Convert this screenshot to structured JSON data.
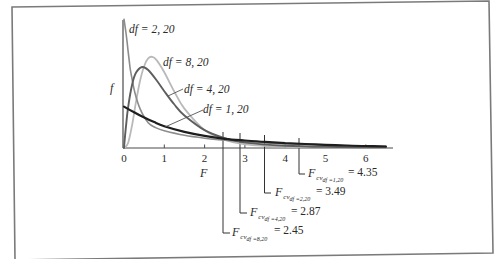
{
  "chart_data": {
    "type": "line",
    "title": "",
    "xlabel": "F",
    "ylabel": "f",
    "xlim": [
      0,
      6.7
    ],
    "ylim": [
      0,
      1.15
    ],
    "grid": false,
    "legend": "inline labels on curves",
    "x_ticks": [
      "0",
      "1",
      "2",
      "3",
      "4",
      "5",
      "6"
    ],
    "series": [
      {
        "name": "df = 1, 20",
        "color": "#1e1e1e",
        "width": 2.2,
        "x": [
          0,
          0.25,
          0.5,
          0.75,
          1,
          1.5,
          2,
          2.5,
          3,
          3.5,
          4,
          4.5,
          5,
          5.5,
          6,
          6.5
        ],
        "y": [
          0.36,
          0.31,
          0.265,
          0.225,
          0.19,
          0.14,
          0.105,
          0.08,
          0.065,
          0.053,
          0.043,
          0.035,
          0.028,
          0.022,
          0.017,
          0.013
        ]
      },
      {
        "name": "df = 2, 20",
        "color": "#8c8c8c",
        "width": 1.6,
        "x": [
          0,
          0.05,
          0.1,
          0.15,
          0.2,
          0.27,
          0.4,
          0.6,
          0.8,
          1,
          1.5,
          2,
          2.5,
          3,
          4,
          5,
          6,
          6.5
        ],
        "y": [
          1.12,
          1.0,
          0.85,
          0.7,
          0.6,
          0.48,
          0.34,
          0.22,
          0.175,
          0.15,
          0.11,
          0.085,
          0.068,
          0.055,
          0.037,
          0.025,
          0.017,
          0.014
        ]
      },
      {
        "name": "df = 4, 20",
        "color": "#5e5e5e",
        "width": 1.9,
        "x": [
          0,
          0.05,
          0.1,
          0.2,
          0.3,
          0.45,
          0.6,
          0.8,
          1,
          1.25,
          1.5,
          2,
          2.5,
          3,
          4,
          5,
          6,
          6.5
        ],
        "y": [
          0,
          0.19,
          0.347,
          0.55,
          0.656,
          0.704,
          0.678,
          0.593,
          0.494,
          0.378,
          0.283,
          0.155,
          0.085,
          0.047,
          0.02,
          0.01,
          0.006,
          0.005
        ]
      },
      {
        "name": "df = 8, 20",
        "color": "#b9b9b9",
        "width": 1.8,
        "x": [
          0,
          0.1,
          0.2,
          0.3,
          0.4,
          0.5,
          0.6,
          0.7,
          0.8,
          1,
          1.25,
          1.5,
          2,
          2.5,
          3,
          4,
          5,
          6,
          6.5
        ],
        "y": [
          0,
          0.042,
          0.199,
          0.405,
          0.587,
          0.713,
          0.779,
          0.793,
          0.769,
          0.659,
          0.49,
          0.343,
          0.156,
          0.07,
          0.032,
          0.01,
          0.005,
          0.003,
          0.002
        ]
      }
    ],
    "critical_values": [
      {
        "symbol": "F",
        "sub": "cv",
        "df": "df =8,20",
        "eq": "= 2.45",
        "value": 2.45
      },
      {
        "symbol": "F",
        "sub": "cv",
        "df": "df =4,20",
        "eq": "= 2.87",
        "value": 2.87
      },
      {
        "symbol": "F",
        "sub": "cv",
        "df": "df =2,20",
        "eq": "= 3.49",
        "value": 3.49
      },
      {
        "symbol": "F",
        "sub": "cv",
        "df": "df =1,20",
        "eq": "= 4.35",
        "value": 4.35
      }
    ],
    "curve_labels": {
      "df2": "df = 2, 20",
      "df8": "df = 8, 20",
      "df4": "df = 4, 20",
      "df1": "df = 1, 20"
    }
  }
}
